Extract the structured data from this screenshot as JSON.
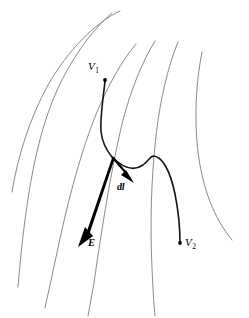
{
  "figure": {
    "background_color": "#ffffff",
    "equipotential_color": "#7d7d82",
    "path_color": "#141414",
    "vector_color": "#000000",
    "labels": {
      "v1": "V",
      "v1_sub": "1",
      "v2": "V",
      "v2_sub": "2",
      "dl": "dl",
      "e": "E"
    },
    "vectors": [
      {
        "name": "dl",
        "label": "dl",
        "from": [
          112,
          157
        ],
        "to": [
          133,
          182
        ]
      },
      {
        "name": "E",
        "label": "E",
        "from": [
          112,
          157
        ],
        "to": [
          79,
          246
        ]
      }
    ],
    "points": [
      {
        "name": "V1",
        "label": "V",
        "sub": "1",
        "at": [
          105,
          80
        ]
      },
      {
        "name": "V2",
        "label": "V",
        "sub": "2",
        "at": [
          180,
          243
        ]
      }
    ]
  }
}
